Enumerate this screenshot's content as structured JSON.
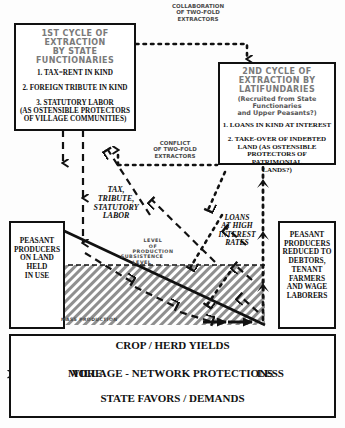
{
  "diagram": {
    "title_top_annotation": {
      "lines": [
        "COLLABORATION",
        "OF TWO-FOLD",
        "EXTRACTORS"
      ]
    },
    "conflict_annotation": {
      "lines": [
        "CONFLICT",
        "OF TWO-FOLD",
        "EXTRACTORS"
      ]
    },
    "box_first_cycle": {
      "heading": [
        "1ST CYCLE OF",
        "EXTRACTION",
        "BY STATE",
        "FUNCTIONARIES"
      ],
      "items": [
        "1. TAX=RENT IN KIND",
        "2. FOREIGN TRIBUTE IN KIND",
        "3. STATUTORY LABOR",
        "(AS OSTENSIBLE PROTECTORS",
        "OF VILLAGE COMMUNITIES)"
      ]
    },
    "box_second_cycle": {
      "heading": [
        "2ND CYCLE OF",
        "EXTRACTION BY",
        "LATIFUNDARIES"
      ],
      "subheading": [
        "(Recruited from State",
        "Functionaries",
        "and Upper Peasants?)"
      ],
      "items": [
        "1. LOANS IN KIND AT INTEREST",
        "2. TAKE-OVER OF INDEBTED",
        "LAND (AS OSTENSIBLE",
        "PROTECTORS OF PATRIMONIAL",
        "LANDS?)"
      ]
    },
    "box_peasant_left": {
      "lines": [
        "PEASANT",
        "PRODUCERS",
        "ON LAND",
        "HELD",
        "IN USE"
      ]
    },
    "box_peasant_right": {
      "lines": [
        "PEASANT",
        "PRODUCERS",
        "REDUCED TO",
        "DEBTORS,",
        "TENANT",
        "FARMERS",
        "AND WAGE",
        "LABORERS"
      ]
    },
    "flow_left_label": {
      "lines": [
        "TAX,",
        "TRIBUTE,",
        "STATUTORY",
        "LABOR"
      ]
    },
    "flow_right_label": {
      "lines": [
        "LOANS",
        "AT HIGH",
        "INTEREST",
        "RATES"
      ]
    },
    "level_of_production_label": {
      "lines": [
        "LEVEL",
        "OF",
        "PRODUCTION"
      ]
    },
    "subsistence_label": {
      "lines": [
        "SUBSISTENCE",
        "LEVEL"
      ]
    },
    "mass_production_label": "MASS PRODUCTION",
    "bottom_scale": {
      "top_line": "CROP / HERD YIELDS",
      "left_label": "MORE",
      "middle_line": "VILLAGE - NETWORK PROTECTIONS",
      "right_label": "LESS",
      "bottom_line": "STATE FAVORS / DEMANDS"
    },
    "colors": {
      "ink": "#111111",
      "heading_gray": "#7a7a7a",
      "hatch_gray": "#9a9a9a",
      "paper": "#fdfdfd"
    }
  }
}
